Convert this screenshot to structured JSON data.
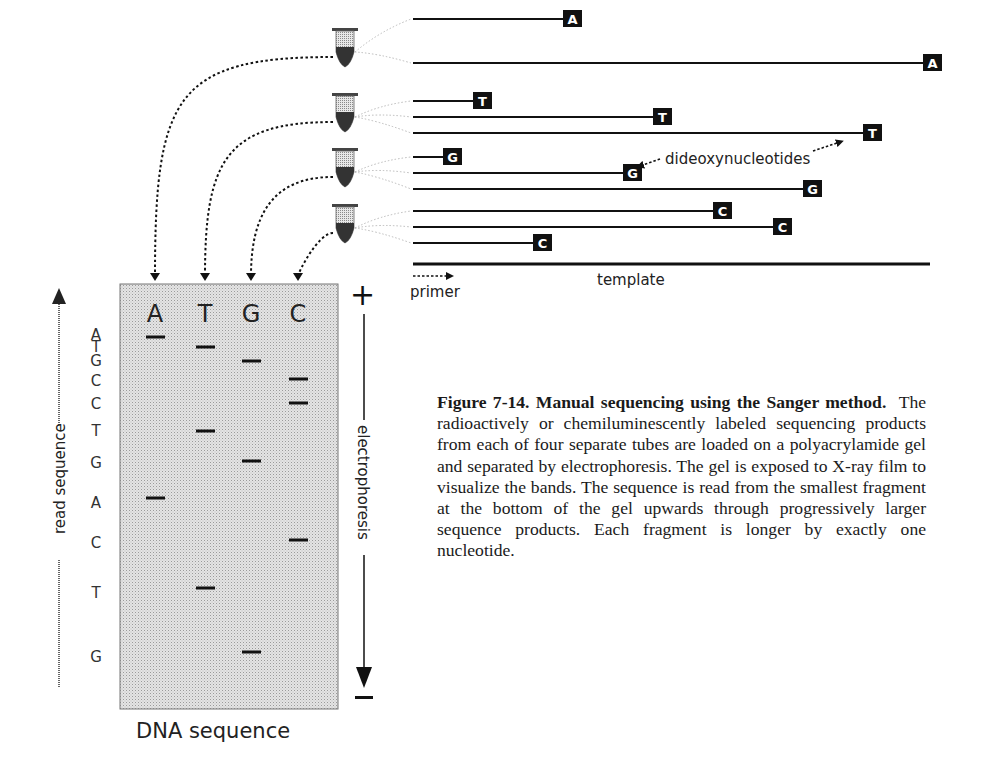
{
  "figure": {
    "caption_title": "Figure 7-14. Manual sequencing using the Sanger method.",
    "caption_body": "The radioactively or chemiluminescently labeled sequencing products from each of four separate tubes are loaded on a polyacrylamide gel and separated by electrophoresis.  The gel is exposed to X-ray film to visualize the bands.  The sequence is read from the smallest fragment at the bottom of the gel upwards through progressively larger sequence products.  Each fragment is longer by exactly one nucleotide."
  },
  "labels": {
    "dideoxy": "dideoxynucleotides",
    "template": "template",
    "primer": "primer",
    "dna_sequence": "DNA sequence",
    "read_sequence": "read sequence",
    "electrophoresis": "electrophoresis",
    "plus": "+",
    "minus": "−"
  },
  "tubes": [
    {
      "base": "A",
      "fragment_lengths": [
        5,
        17
      ]
    },
    {
      "base": "T",
      "fragment_lengths": [
        2,
        8,
        15
      ]
    },
    {
      "base": "G",
      "fragment_lengths": [
        1,
        7,
        13
      ]
    },
    {
      "base": "C",
      "fragment_lengths": [
        10,
        12,
        4
      ]
    }
  ],
  "gel": {
    "lanes": [
      "A",
      "T",
      "G",
      "C"
    ],
    "read_sequence": [
      "A",
      "T",
      "G",
      "C",
      "C",
      "T",
      "G",
      "A",
      "C",
      "T",
      "G"
    ]
  },
  "colors": {
    "ink": "#111111",
    "gel_fill": "#d9d9d9",
    "tag_fill": "#111111",
    "tag_text": "#ffffff"
  }
}
